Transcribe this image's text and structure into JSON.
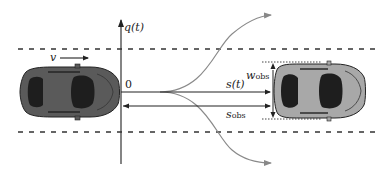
{
  "diagram": {
    "labels": {
      "vertical_axis": "q(t)",
      "origin": "0",
      "velocity": "v",
      "longitudinal_distance": "s(t)",
      "obstacle_distance_main": "s",
      "obstacle_distance_sub": "obs",
      "obstacle_width_main": "w",
      "obstacle_width_sub": "obs"
    },
    "ego_vehicle": {
      "color": "#5a5a5a",
      "window_color": "#1e1e1e",
      "position": "left, in lane center"
    },
    "obstacle_vehicle": {
      "color": "#a8a8a8",
      "window_color": "#1e1e1e",
      "position": "right, in lane center"
    },
    "trajectories": [
      {
        "name": "upper-lane-change",
        "direction": "left/up",
        "color": "#8a8a8a"
      },
      {
        "name": "lower-lane-change",
        "direction": "right/down",
        "color": "#8a8a8a"
      }
    ],
    "colors": {
      "axis": "#333333",
      "lane_dashes": "#333333",
      "trajectory": "#8a8a8a",
      "dotted_bounds": "#444444"
    }
  }
}
